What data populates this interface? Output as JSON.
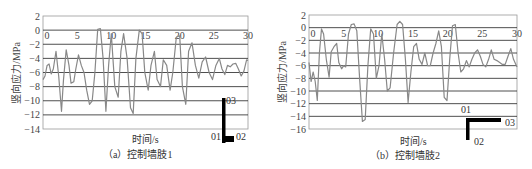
{
  "chart_data": [
    {
      "type": "line",
      "title": "",
      "caption": "（a）控制墙肢1",
      "xlabel": "时间/s",
      "ylabel": "竖向应力/MPa",
      "xlim": [
        0,
        30
      ],
      "ylim": [
        -14,
        2
      ],
      "xticks": [
        0,
        5,
        10,
        15,
        20,
        25,
        30
      ],
      "yticks": [
        2,
        0,
        -2,
        -4,
        -6,
        -8,
        -10,
        -12,
        -14
      ],
      "grid": "horizontal",
      "legend": null,
      "series": [
        {
          "name": "控制墙肢1",
          "x": [
            0,
            0.3,
            0.6,
            0.9,
            1.2,
            1.5,
            1.9,
            2.3,
            2.7,
            3.0,
            3.4,
            3.8,
            4.1,
            4.5,
            4.8,
            5.2,
            5.6,
            6.0,
            6.4,
            6.8,
            7.2,
            7.6,
            8.0,
            8.4,
            8.8,
            9.2,
            9.6,
            10.0,
            10.5,
            11.0,
            11.4,
            11.8,
            12.3,
            12.8,
            13.2,
            13.6,
            14.1,
            14.5,
            14.9,
            15.4,
            15.8,
            16.3,
            16.7,
            17.2,
            17.6,
            18.1,
            18.6,
            19.0,
            19.5,
            20.0,
            20.4,
            20.9,
            21.3,
            21.8,
            22.3,
            22.8,
            23.3,
            23.8,
            24.3,
            24.8,
            25.3,
            25.8,
            26.2,
            26.6,
            27.0,
            27.4,
            27.8,
            28.2,
            28.6,
            29.0,
            29.4,
            29.8,
            30.0
          ],
          "values": [
            -7.0,
            -6.5,
            -5.0,
            -4.8,
            -6.2,
            -5.5,
            -3.0,
            -6.5,
            -11.5,
            -7.0,
            -2.8,
            -5.0,
            -7.5,
            -7.3,
            -5.5,
            -3.5,
            -5.0,
            -6.0,
            -8.5,
            -10.5,
            -10.0,
            -6.0,
            0.1,
            0.2,
            -4.0,
            -11.5,
            -5.0,
            -0.5,
            -8.0,
            -9.5,
            -3.0,
            -0.5,
            -4.0,
            -11.0,
            -11.8,
            -4.0,
            0.0,
            -0.5,
            -6.0,
            -8.5,
            -5.0,
            -3.0,
            -7.0,
            -8.0,
            -4.2,
            -5.0,
            -8.5,
            -6.0,
            -1.0,
            -0.8,
            -8.0,
            -10.5,
            -3.0,
            -1.8,
            -5.0,
            -6.8,
            -4.5,
            -3.8,
            -6.0,
            -7.0,
            -5.0,
            -4.0,
            -5.5,
            -6.3,
            -5.0,
            -5.2,
            -4.8,
            -4.7,
            -5.5,
            -6.5,
            -5.8,
            -4.2,
            -4.3
          ]
        }
      ],
      "annotation": {
        "labels": [
          "01",
          "02",
          "03"
        ],
        "shape": "L-marker"
      }
    },
    {
      "type": "line",
      "title": "",
      "caption": "（b）控制墙肢2",
      "xlabel": "时间/s",
      "ylabel": "竖向应力/MPa",
      "xlim": [
        0,
        30
      ],
      "ylim": [
        -16,
        2
      ],
      "xticks": [
        0,
        5,
        10,
        15,
        20,
        25,
        30
      ],
      "yticks": [
        2,
        0,
        -2,
        -4,
        -6,
        -8,
        -10,
        -12,
        -14,
        -16
      ],
      "grid": "horizontal",
      "legend": null,
      "series": [
        {
          "name": "控制墙肢2",
          "x": [
            0,
            0.3,
            0.6,
            0.9,
            1.2,
            1.5,
            1.8,
            2.1,
            2.5,
            2.9,
            3.2,
            3.6,
            4.0,
            4.3,
            4.7,
            5.0,
            5.3,
            5.7,
            6.1,
            6.5,
            6.9,
            7.3,
            7.7,
            8.1,
            8.5,
            8.9,
            9.3,
            9.7,
            10.1,
            10.5,
            10.9,
            11.3,
            11.7,
            12.2,
            12.7,
            13.1,
            13.5,
            13.9,
            14.3,
            14.7,
            15.1,
            15.5,
            15.9,
            16.3,
            16.7,
            17.1,
            17.5,
            17.9,
            18.3,
            18.7,
            19.1,
            19.5,
            19.9,
            20.3,
            20.7,
            21.1,
            21.5,
            21.9,
            22.3,
            22.7,
            23.1,
            23.5,
            23.9,
            24.3,
            24.7,
            25.1,
            25.5,
            25.9,
            26.3,
            26.7,
            27.1,
            27.5,
            27.9,
            28.3,
            28.7,
            29.1,
            29.5,
            30.0
          ],
          "values": [
            -5.5,
            -8.5,
            -7.0,
            -8.5,
            -11.5,
            -4.0,
            -0.2,
            -1.0,
            -5.0,
            -7.8,
            -3.8,
            -3.0,
            -2.5,
            -5.5,
            -6.5,
            -6.0,
            -6.2,
            -1.0,
            0.5,
            0.6,
            -0.5,
            -8.0,
            -14.8,
            -14.5,
            -6.0,
            -0.2,
            -1.0,
            -8.0,
            -6.0,
            -1.0,
            -5.0,
            -10.0,
            -9.5,
            -4.0,
            0.5,
            1.0,
            0.5,
            -5.0,
            -11.8,
            -7.0,
            -3.0,
            -2.5,
            -5.0,
            -5.8,
            -4.0,
            -6.0,
            -6.0,
            -4.0,
            -2.5,
            -0.5,
            -3.0,
            -11.0,
            -11.5,
            -5.0,
            0.3,
            0.5,
            -4.0,
            -7.0,
            -6.5,
            -5.2,
            -6.2,
            -5.0,
            -4.0,
            -3.5,
            -4.5,
            -5.8,
            -6.2,
            -5.0,
            -3.5,
            -5.0,
            -5.2,
            -5.5,
            -5.8,
            -5.8,
            -4.5,
            -3.3,
            -5.0,
            -6.2
          ]
        }
      ],
      "annotation": {
        "labels": [
          "01",
          "02",
          "03"
        ],
        "shape": "L-marker"
      }
    }
  ]
}
